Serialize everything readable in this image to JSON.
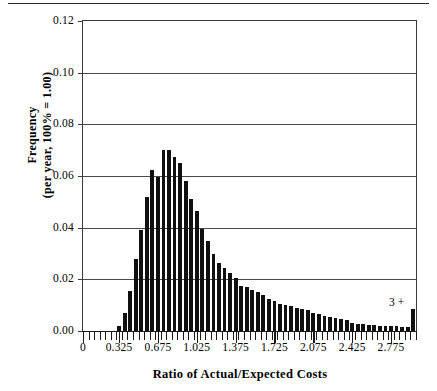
{
  "page": {
    "has_top_rule": true
  },
  "chart_data": {
    "type": "bar",
    "title": "",
    "xlabel": "Ratio of Actual/Expected Costs",
    "ylabel": "Frequency\n(per year, 100% = 1.00)",
    "ylabel_line1": "Frequency",
    "ylabel_line2": "(per year, 100% = 1.00)",
    "ylim": [
      0,
      0.12
    ],
    "xlim": [
      0,
      3.0
    ],
    "grid": true,
    "legend": null,
    "bin_width": 0.05,
    "ytick_labels": [
      "0.12",
      "0.10",
      "0.08",
      "0.06",
      "0.04",
      "0.02",
      "0.00"
    ],
    "ytick_values": [
      0.12,
      0.1,
      0.08,
      0.06,
      0.04,
      0.02,
      0.0
    ],
    "xtick_labels": [
      "0",
      "0.325",
      "0.675",
      "1.025",
      "1.375",
      "1.725",
      "2.075",
      "2.425",
      "2.775"
    ],
    "xtick_values": [
      0,
      0.325,
      0.675,
      1.025,
      1.375,
      1.725,
      2.075,
      2.425,
      2.775
    ],
    "annotations": [
      {
        "text": "3 +",
        "x": 2.95,
        "y": 0.0105,
        "note": "overflow bin label at right edge"
      }
    ],
    "bin_centers": [
      0.025,
      0.075,
      0.125,
      0.175,
      0.225,
      0.275,
      0.325,
      0.375,
      0.425,
      0.475,
      0.525,
      0.575,
      0.625,
      0.675,
      0.725,
      0.775,
      0.825,
      0.875,
      0.925,
      0.975,
      1.025,
      1.075,
      1.125,
      1.175,
      1.225,
      1.275,
      1.325,
      1.375,
      1.425,
      1.475,
      1.525,
      1.575,
      1.625,
      1.675,
      1.725,
      1.775,
      1.825,
      1.875,
      1.925,
      1.975,
      2.025,
      2.075,
      2.125,
      2.175,
      2.225,
      2.275,
      2.325,
      2.375,
      2.425,
      2.475,
      2.525,
      2.575,
      2.625,
      2.675,
      2.725,
      2.775,
      2.825,
      2.875,
      2.925,
      2.975
    ],
    "values": [
      0.0,
      0.0,
      0.0,
      0.0,
      0.0,
      0.0,
      0.002,
      0.007,
      0.0155,
      0.028,
      0.039,
      0.052,
      0.0625,
      0.0595,
      0.07,
      0.07,
      0.0675,
      0.065,
      0.058,
      0.051,
      0.0465,
      0.0395,
      0.035,
      0.03,
      0.0265,
      0.0245,
      0.0225,
      0.0205,
      0.0175,
      0.017,
      0.016,
      0.015,
      0.014,
      0.0125,
      0.0115,
      0.0105,
      0.01,
      0.0095,
      0.009,
      0.0085,
      0.008,
      0.007,
      0.0065,
      0.006,
      0.0055,
      0.005,
      0.0045,
      0.0042,
      0.003,
      0.0028,
      0.0026,
      0.0024,
      0.0022,
      0.002,
      0.002,
      0.0018,
      0.0018,
      0.0016,
      0.0016,
      0.0085
    ]
  }
}
